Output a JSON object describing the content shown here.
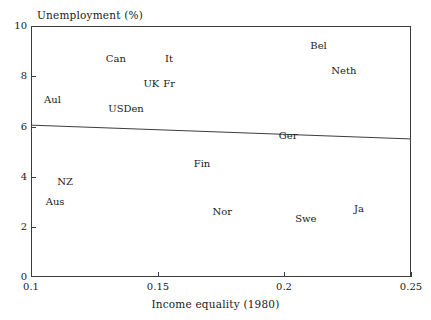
{
  "chart_data": {
    "type": "scatter",
    "title": "",
    "xlabel": "Income equality (1980)",
    "ylabel": "Unemployment (%)",
    "xlim": [
      0.1,
      0.25
    ],
    "ylim": [
      0,
      10
    ],
    "xticks": [
      "0.1",
      "0.15",
      "0.2",
      "0.25"
    ],
    "xtick_values": [
      0.1,
      0.15,
      0.2,
      0.25
    ],
    "yticks": [
      "0",
      "2",
      "4",
      "6",
      "8",
      "10"
    ],
    "ytick_values": [
      0,
      2,
      4,
      6,
      8,
      10
    ],
    "grid": false,
    "legend": null,
    "marker_style": "text-label-only",
    "points": [
      {
        "label": "Aul",
        "x": 0.1085,
        "y": 7.05
      },
      {
        "label": "Aus",
        "x": 0.1095,
        "y": 3.0
      },
      {
        "label": "NZ",
        "x": 0.1135,
        "y": 3.8
      },
      {
        "label": "US",
        "x": 0.1335,
        "y": 6.7
      },
      {
        "label": "Den",
        "x": 0.1405,
        "y": 6.7
      },
      {
        "label": "Can",
        "x": 0.1335,
        "y": 8.7
      },
      {
        "label": "UK",
        "x": 0.1475,
        "y": 7.7
      },
      {
        "label": "Fr",
        "x": 0.1545,
        "y": 7.7
      },
      {
        "label": "It",
        "x": 0.1545,
        "y": 8.7
      },
      {
        "label": "Fin",
        "x": 0.1675,
        "y": 4.5
      },
      {
        "label": "Nor",
        "x": 0.1755,
        "y": 2.6
      },
      {
        "label": "Ger",
        "x": 0.2015,
        "y": 5.6
      },
      {
        "label": "Bel",
        "x": 0.2135,
        "y": 9.2
      },
      {
        "label": "Swe",
        "x": 0.2085,
        "y": 2.3
      },
      {
        "label": "Neth",
        "x": 0.2235,
        "y": 8.2
      },
      {
        "label": "Ja",
        "x": 0.2295,
        "y": 2.7
      }
    ],
    "trend_line": {
      "x_start": 0.1,
      "y_start": 6.05,
      "x_end": 0.25,
      "y_end": 5.5
    },
    "axis_color": "#3c3c3c",
    "text_color": "#1a1a1a",
    "line_color": "#3c3c3c"
  }
}
